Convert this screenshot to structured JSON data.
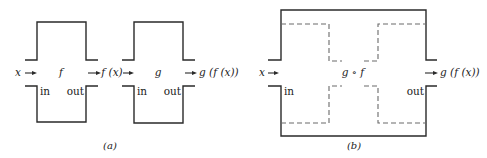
{
  "figure_a": {
    "caption": "(a)",
    "box_f": {
      "function_label": "f",
      "in_label": "in",
      "out_label": "out"
    },
    "box_g": {
      "function_label": "g",
      "in_label": "in",
      "out_label": "out"
    },
    "input_label": "x",
    "middle_label": "f (x)",
    "output_label": "g (f (x))"
  },
  "figure_b": {
    "caption": "(b)",
    "box_composite": {
      "function_label": "g ∘ f",
      "in_label": "in",
      "out_label": "out"
    },
    "input_label": "x",
    "output_label": "g (f (x))"
  },
  "colors": {
    "line": "#2a2a2a",
    "dashed_line": "#6a6a6a",
    "background": "#ffffff"
  }
}
